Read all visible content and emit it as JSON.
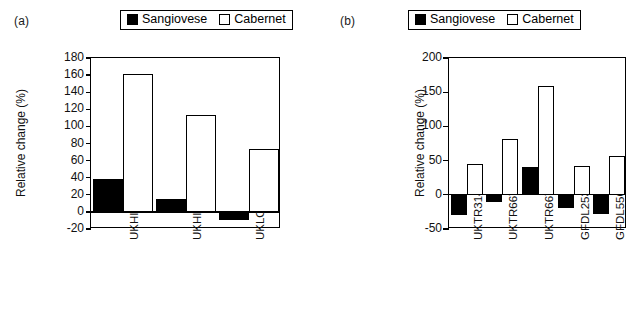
{
  "figure": {
    "panels": [
      {
        "tag": "(a)",
        "ylabel": "Relative change (%)",
        "legend": [
          {
            "label": "Sangiovese",
            "swatch": "filled-square-icon"
          },
          {
            "label": "Cabernet",
            "swatch": "open-square-icon"
          }
        ]
      },
      {
        "tag": "(b)",
        "ylabel": "Relative change (%)",
        "legend": [
          {
            "label": "Sangiovese",
            "swatch": "filled-square-icon"
          },
          {
            "label": "Cabernet",
            "swatch": "open-square-icon"
          }
        ]
      }
    ]
  },
  "chart_data": [
    {
      "type": "bar",
      "panel": "(a)",
      "title": "",
      "xlabel": "",
      "ylabel": "Relative change (%)",
      "categories": [
        "UKHI",
        "UKHI",
        "UKLO"
      ],
      "series": [
        {
          "name": "Sangiovese",
          "values": [
            38,
            15,
            -9
          ]
        },
        {
          "name": "Cabernet",
          "values": [
            161,
            113,
            74
          ]
        }
      ],
      "ylim": [
        -20,
        180
      ],
      "yticks": [
        -20,
        0,
        20,
        40,
        60,
        80,
        100,
        120,
        140,
        160,
        180
      ],
      "ytick_labels": [
        "-20",
        "0",
        "20",
        "40",
        "60",
        "80",
        "100",
        "120",
        "140",
        "160",
        "180"
      ],
      "grid": false,
      "legend_position": "top"
    },
    {
      "type": "bar",
      "panel": "(b)",
      "title": "",
      "xlabel": "",
      "ylabel": "Relative change (%)",
      "categories": [
        "UKTR3140",
        "UKTR6675",
        "UKTR6675a",
        "GFDL2534a",
        "GFDL5564"
      ],
      "series": [
        {
          "name": "Sangiovese",
          "values": [
            -30,
            -10,
            41,
            -20,
            -28
          ]
        },
        {
          "name": "Cabernet",
          "values": [
            45,
            81,
            159,
            42,
            57
          ]
        }
      ],
      "ylim": [
        -50,
        200
      ],
      "yticks": [
        -50,
        0,
        50,
        100,
        150,
        200
      ],
      "ytick_labels": [
        "-50",
        "0",
        "50",
        "100",
        "150",
        "200"
      ],
      "grid": false,
      "legend_position": "top"
    }
  ]
}
